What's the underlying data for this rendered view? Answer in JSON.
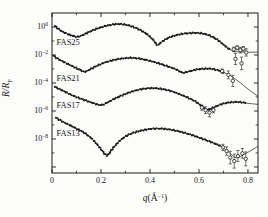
{
  "figure": {
    "bg": "#fcfcfa",
    "ink": "#1a1a1a",
    "width": 268,
    "height": 217
  },
  "chart_data": {
    "type": "line",
    "title": "",
    "xlabel": {
      "q": "q",
      "open": "(",
      "unit": "Å",
      "sup": "−1",
      "close": ")"
    },
    "ylabel": {
      "main": "R/R",
      "sub": "F"
    },
    "x_axis": {
      "min": 0,
      "max": 0.841,
      "major_ticks": [
        0,
        0.2,
        0.4,
        0.6,
        0.8
      ],
      "major_labels": [
        "0",
        "0.2",
        "0.4",
        "0.6",
        "0.8"
      ],
      "minor_ticks": [
        0.1,
        0.3,
        0.5,
        0.7
      ]
    },
    "y_axis": {
      "scale": "log",
      "base": "10",
      "top_exp": 1,
      "bottom_exp": -10.43,
      "major_tick_exps": [
        0,
        -2,
        -4,
        -6,
        -8,
        -10
      ],
      "labeled_exps": [
        0,
        -2,
        -4,
        -6,
        -8
      ],
      "major_labels": [
        "0",
        "−2",
        "−4",
        "−6",
        "−8"
      ],
      "minor_tick_exps": [
        -1,
        -3,
        -5,
        -7,
        -9
      ]
    },
    "plot": {
      "left": 52,
      "right": 258,
      "top": 13,
      "bottom": 173
    },
    "series": [
      {
        "name": "FAS25",
        "label": "FAS25",
        "label_at": [
          0.018,
          -1.3
        ],
        "points": [
          [
            0.012,
            0.07
          ],
          [
            0.035,
            -0.25
          ],
          [
            0.06,
            -0.48
          ],
          [
            0.085,
            -0.63
          ],
          [
            0.103,
            -0.7
          ],
          [
            0.125,
            -0.58
          ],
          [
            0.155,
            -0.33
          ],
          [
            0.195,
            -0.05
          ],
          [
            0.24,
            0.15
          ],
          [
            0.28,
            0.21
          ],
          [
            0.315,
            0.1
          ],
          [
            0.35,
            -0.13
          ],
          [
            0.385,
            -0.48
          ],
          [
            0.413,
            -0.92
          ],
          [
            0.43,
            -1.28
          ],
          [
            0.447,
            -1.08
          ],
          [
            0.475,
            -0.78
          ],
          [
            0.515,
            -0.55
          ],
          [
            0.56,
            -0.44
          ],
          [
            0.605,
            -0.44
          ],
          [
            0.645,
            -0.62
          ],
          [
            0.678,
            -0.95
          ],
          [
            0.705,
            -1.33
          ],
          [
            0.727,
            -1.62
          ]
        ],
        "fit_extension": [
          [
            0.748,
            -1.75
          ],
          [
            0.78,
            -1.79
          ],
          [
            0.841,
            -1.8
          ]
        ],
        "scatter": [
          [
            0.742,
            -1.6,
            0.16
          ],
          [
            0.756,
            -1.48,
            0.14
          ],
          [
            0.769,
            -1.66,
            0.2
          ],
          [
            0.781,
            -1.55,
            0.16
          ],
          [
            0.793,
            -1.82,
            0.26
          ],
          [
            0.749,
            -2.28,
            0.4
          ],
          [
            0.774,
            -2.6,
            0.45
          ]
        ]
      },
      {
        "name": "FAS21",
        "label": "FAS21",
        "label_at": [
          0.018,
          -3.84
        ],
        "points": [
          [
            0.006,
            -2.06
          ],
          [
            0.03,
            -2.33
          ],
          [
            0.06,
            -2.6
          ],
          [
            0.09,
            -2.86
          ],
          [
            0.115,
            -3.07
          ],
          [
            0.134,
            -3.2
          ],
          [
            0.155,
            -3.03
          ],
          [
            0.19,
            -2.72
          ],
          [
            0.23,
            -2.46
          ],
          [
            0.275,
            -2.28
          ],
          [
            0.325,
            -2.21
          ],
          [
            0.375,
            -2.32
          ],
          [
            0.425,
            -2.54
          ],
          [
            0.47,
            -2.8
          ],
          [
            0.505,
            -3.02
          ],
          [
            0.533,
            -3.26
          ],
          [
            0.558,
            -3.18
          ],
          [
            0.595,
            -3.03
          ],
          [
            0.64,
            -2.97
          ],
          [
            0.675,
            -3.08
          ],
          [
            0.705,
            -3.27
          ]
        ],
        "fit_extension": [
          [
            0.735,
            -3.55
          ],
          [
            0.77,
            -4.0
          ],
          [
            0.805,
            -4.5
          ],
          [
            0.841,
            -4.95
          ]
        ],
        "scatter": [
          [
            0.695,
            -3.15,
            0.15
          ],
          [
            0.72,
            -3.42,
            0.28
          ],
          [
            0.738,
            -3.85,
            0.4
          ]
        ]
      },
      {
        "name": "FAS17",
        "label": "FAS17",
        "label_at": [
          0.018,
          -5.82
        ],
        "points": [
          [
            0.012,
            -4.28
          ],
          [
            0.05,
            -4.6
          ],
          [
            0.09,
            -4.94
          ],
          [
            0.13,
            -5.2
          ],
          [
            0.165,
            -5.42
          ],
          [
            0.197,
            -5.57
          ],
          [
            0.218,
            -5.47
          ],
          [
            0.252,
            -5.16
          ],
          [
            0.3,
            -4.78
          ],
          [
            0.35,
            -4.5
          ],
          [
            0.4,
            -4.37
          ],
          [
            0.445,
            -4.42
          ],
          [
            0.49,
            -4.6
          ],
          [
            0.533,
            -4.89
          ],
          [
            0.574,
            -5.21
          ],
          [
            0.608,
            -5.6
          ],
          [
            0.631,
            -5.92
          ],
          [
            0.656,
            -5.78
          ],
          [
            0.69,
            -5.53
          ],
          [
            0.726,
            -5.39
          ],
          [
            0.762,
            -5.36
          ],
          [
            0.793,
            -5.44
          ]
        ],
        "fit_extension": [
          [
            0.841,
            -5.53
          ]
        ],
        "scatter": [
          [
            0.612,
            -5.76,
            0.18
          ],
          [
            0.627,
            -5.94,
            0.24
          ],
          [
            0.643,
            -6.12,
            0.3
          ],
          [
            0.659,
            -5.93,
            0.2
          ]
        ]
      },
      {
        "name": "FAS13",
        "label": "FAS13",
        "label_at": [
          0.018,
          -7.78
        ],
        "points": [
          [
            0.016,
            -6.48
          ],
          [
            0.045,
            -6.78
          ],
          [
            0.075,
            -7.04
          ],
          [
            0.105,
            -7.3
          ],
          [
            0.135,
            -7.6
          ],
          [
            0.165,
            -8.02
          ],
          [
            0.193,
            -8.58
          ],
          [
            0.216,
            -9.08
          ],
          [
            0.228,
            -9.16
          ],
          [
            0.247,
            -8.7
          ],
          [
            0.277,
            -8.12
          ],
          [
            0.315,
            -7.68
          ],
          [
            0.36,
            -7.42
          ],
          [
            0.41,
            -7.27
          ],
          [
            0.46,
            -7.28
          ],
          [
            0.51,
            -7.42
          ],
          [
            0.557,
            -7.64
          ],
          [
            0.605,
            -7.93
          ],
          [
            0.652,
            -8.24
          ],
          [
            0.688,
            -8.5
          ]
        ],
        "fit_extension": [
          [
            0.715,
            -8.85
          ],
          [
            0.742,
            -9.25
          ],
          [
            0.758,
            -9.33
          ],
          [
            0.785,
            -9.1
          ],
          [
            0.841,
            -8.52
          ]
        ],
        "scatter": [
          [
            0.698,
            -8.6,
            0.22
          ],
          [
            0.713,
            -8.86,
            0.3
          ],
          [
            0.728,
            -9.33,
            0.45
          ],
          [
            0.744,
            -9.58,
            0.5
          ],
          [
            0.759,
            -9.22,
            0.4
          ],
          [
            0.777,
            -9.03,
            0.35
          ],
          [
            0.791,
            -9.42,
            0.5
          ]
        ]
      }
    ]
  }
}
